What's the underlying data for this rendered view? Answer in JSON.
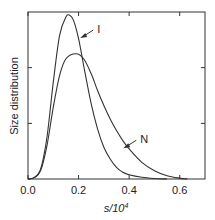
{
  "chart_data": {
    "type": "line",
    "title": "",
    "xlabel": "s/10^4",
    "xlabel_main": "s/10",
    "xlabel_sup": "4",
    "ylabel": "Size distribution",
    "xlim": [
      0,
      0.7
    ],
    "ylim": [
      0,
      1
    ],
    "xticks": [
      "0.0",
      "0.2",
      "0.4",
      "0.6"
    ],
    "xtick_values": [
      0,
      0.2,
      0.4,
      0.6
    ],
    "ytick_values": [
      0.333,
      0.667
    ],
    "grid": false,
    "legend": "none",
    "series": [
      {
        "name": "I",
        "x": [
          0,
          0.025,
          0.05,
          0.075,
          0.1,
          0.125,
          0.15,
          0.165,
          0.18,
          0.2,
          0.225,
          0.25,
          0.275,
          0.3,
          0.325,
          0.35,
          0.375,
          0.4,
          0.45,
          0.5,
          0.55
        ],
        "values": [
          0,
          0.01,
          0.06,
          0.25,
          0.58,
          0.86,
          0.97,
          0.98,
          0.95,
          0.84,
          0.64,
          0.45,
          0.3,
          0.19,
          0.12,
          0.07,
          0.04,
          0.025,
          0.01,
          0.003,
          0
        ]
      },
      {
        "name": "N",
        "x": [
          0,
          0.025,
          0.05,
          0.075,
          0.1,
          0.125,
          0.15,
          0.19,
          0.22,
          0.25,
          0.275,
          0.3,
          0.325,
          0.35,
          0.375,
          0.4,
          0.45,
          0.5,
          0.55,
          0.6,
          0.63
        ],
        "values": [
          0,
          0.008,
          0.05,
          0.2,
          0.43,
          0.62,
          0.72,
          0.75,
          0.72,
          0.63,
          0.53,
          0.44,
          0.36,
          0.29,
          0.23,
          0.18,
          0.1,
          0.05,
          0.02,
          0.005,
          0
        ]
      }
    ],
    "annotations": [
      {
        "label": "I",
        "x": 0.27,
        "y": 0.88
      },
      {
        "label": "N",
        "x": 0.44,
        "y": 0.22
      }
    ]
  }
}
